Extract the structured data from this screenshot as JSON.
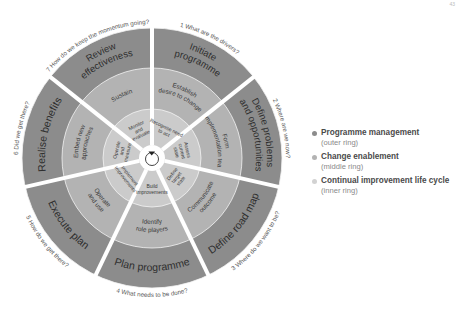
{
  "page_mark": "43",
  "diagram": {
    "type": "concentric-ring-wheel",
    "segments": [
      {
        "num": "1",
        "question": "What are the drivers?",
        "outer": "Initiate programme",
        "middle": "Establish desire to change",
        "inner": "Recognise need to act"
      },
      {
        "num": "2",
        "question": "Where are we now?",
        "outer": "Define problems and opportunities",
        "middle": "Form implementation team",
        "inner": "Assess current state"
      },
      {
        "num": "3",
        "question": "Where do we want to be?",
        "outer": "Define road map",
        "middle": "Communicate outcome",
        "inner": "Define target state"
      },
      {
        "num": "4",
        "question": "What needs to be done?",
        "outer": "Plan programme",
        "middle": "Identify role players",
        "inner": "Build improvements"
      },
      {
        "num": "5",
        "question": "How do we get there?",
        "outer": "Execute plan",
        "middle": "Operate and use",
        "inner": "Implement improvements"
      },
      {
        "num": "6",
        "question": "Did we get there?",
        "outer": "Realise benefits",
        "middle": "Embed new approaches",
        "inner": "Operate and measure"
      },
      {
        "num": "7",
        "question": "How do we keep the momentum going?",
        "outer": "Review effectiveness",
        "middle": "Sustain",
        "inner": "Monitor and evaluate"
      }
    ],
    "colors": {
      "outer": "#8c8c8c",
      "middle": "#b3b3b3",
      "inner": "#cbcbcb",
      "spoke": "#ffffff",
      "text": "#3a3a3a"
    }
  },
  "legend": {
    "items": [
      {
        "title": "Programme management",
        "subtitle": "(outer ring)",
        "color": "#8c8c8c"
      },
      {
        "title": "Change enablement",
        "subtitle": "(middle ring)",
        "color": "#b3b3b3"
      },
      {
        "title": "Continual improvement life cycle",
        "subtitle": "(inner ring)",
        "color": "#cfcfcf"
      }
    ]
  }
}
